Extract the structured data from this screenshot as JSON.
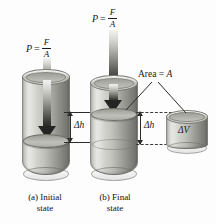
{
  "figure": {
    "title_semantic": "fluid-compression-bulk-modulus-diagram",
    "background_color": "#fdfdfd",
    "ink_color": "#1a1a1a"
  },
  "pressure_initial": {
    "lhs": "P",
    "eq": "=",
    "numerator": "F",
    "denominator": "A"
  },
  "pressure_final": {
    "lhs": "P",
    "eq": "=",
    "numerator": "F",
    "denominator": "A"
  },
  "measurements": {
    "delta_h_left": "Δh",
    "delta_h_right": "Δh",
    "delta_v": "ΔV",
    "area_label_prefix": "Area = ",
    "area_label_symbol": "A"
  },
  "captions": {
    "initial": {
      "tag": "(a) Initial",
      "line2": "state"
    },
    "final": {
      "tag": "(b) Final",
      "line2": "state"
    }
  },
  "colors": {
    "cylinder_light": "#cfcfca",
    "cylinder_dark": "#949490",
    "arrow_dark": "#242422",
    "arrow_light": "#f2f2f0",
    "line": "#2b2b2b"
  }
}
